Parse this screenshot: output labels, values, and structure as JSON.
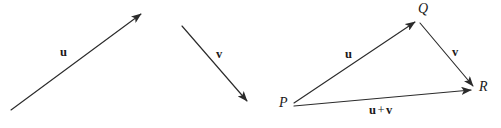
{
  "figure": {
    "stroke_color": "#2b2b2b",
    "background_color": "#ffffff",
    "panels": [
      {
        "name": "vector-u-panel",
        "arrows": [
          {
            "name": "vector-u-arrow",
            "label": "u",
            "from": [
              11,
              110
            ],
            "to": [
              141,
              14
            ],
            "label_pos": [
              60,
              46
            ]
          }
        ]
      },
      {
        "name": "vector-v-panel",
        "arrows": [
          {
            "name": "vector-v-arrow",
            "label": "v",
            "from": [
              182,
              26
            ],
            "to": [
              247,
              101
            ],
            "label_pos": [
              216,
              48
            ]
          }
        ]
      },
      {
        "name": "triangle-panel",
        "points": [
          {
            "name": "point-p",
            "label": "P",
            "pos": [
              292,
              104
            ],
            "label_pos": [
              279,
              96
            ]
          },
          {
            "name": "point-q",
            "label": "Q",
            "pos": [
              417,
              20
            ],
            "label_pos": [
              418,
              2
            ]
          },
          {
            "name": "point-r",
            "label": "R",
            "pos": [
              474,
              88
            ],
            "label_pos": [
              479,
              80
            ]
          }
        ],
        "arrows": [
          {
            "name": "triangle-vector-u-arrow",
            "label": "u",
            "from": [
              294,
              103
            ],
            "to": [
              415,
              22
            ],
            "label_pos": [
              345,
              48
            ]
          },
          {
            "name": "triangle-vector-v-arrow",
            "label": "v",
            "from": [
              420,
              23
            ],
            "to": [
              473,
              86
            ],
            "label_pos": [
              452,
              46
            ]
          },
          {
            "name": "triangle-vector-sum-arrow",
            "label_bold_1": "u",
            "label_operator": "+",
            "label_bold_2": "v",
            "from": [
              294,
              106
            ],
            "to": [
              471,
              90
            ],
            "label_pos": [
              369,
              104
            ]
          }
        ]
      }
    ]
  }
}
